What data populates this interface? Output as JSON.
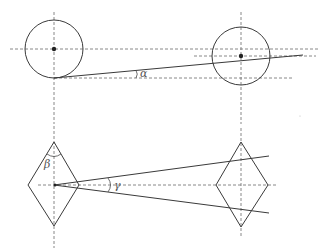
{
  "diagram": {
    "type": "geometric-projection-sketch",
    "labels": {
      "alpha": "α",
      "beta": "β",
      "gamma": "γ"
    },
    "colors": {
      "stroke": "#3a3a3a",
      "dashed": "#7a7a7a",
      "label": "#555555"
    },
    "top_view": {
      "left_circle": {
        "cx": 54,
        "cy": 49,
        "r": 29
      },
      "right_circle": {
        "cx": 241,
        "cy": 56,
        "r": 29
      },
      "tangent_line": {
        "x1": 54,
        "y1": 78,
        "x2": 303,
        "y2": 55
      }
    },
    "bottom_view": {
      "left_diamond": {
        "top": [
          54,
          142
        ],
        "right": [
          79,
          185
        ],
        "bottom": [
          54,
          226
        ],
        "left": [
          28,
          185
        ]
      },
      "right_diamond": {
        "top": [
          241,
          142
        ],
        "right": [
          268,
          185
        ],
        "bottom": [
          241,
          227
        ],
        "left": [
          216,
          185
        ]
      },
      "upper_ray": {
        "x1": 54,
        "y1": 185,
        "x2": 269,
        "y2": 156
      },
      "lower_ray": {
        "x1": 54,
        "y1": 185,
        "x2": 269,
        "y2": 213
      }
    }
  }
}
